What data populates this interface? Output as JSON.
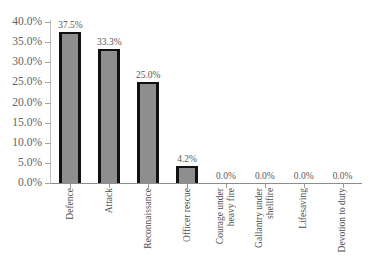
{
  "chart_data": {
    "type": "bar",
    "title": "",
    "subtitle": "",
    "xlabel": "",
    "ylabel": "",
    "ylim": [
      0,
      40
    ],
    "grid": false,
    "legend": false,
    "orientation": "vertical",
    "categories": [
      "Defence",
      "Attack",
      "Reconnaissance",
      "Officer rescue",
      "Courage under heavy fire",
      "Gallantry under shellfire",
      "Lifesaving",
      "Devotion to duty"
    ],
    "category_lines": [
      [
        "Defence"
      ],
      [
        "Attack"
      ],
      [
        "Reconnaissance"
      ],
      [
        "Officer rescue"
      ],
      [
        "Courage under",
        "heavy fire"
      ],
      [
        "Gallantry under",
        "shellfire"
      ],
      [
        "Lifesaving"
      ],
      [
        "Devotion to duty"
      ]
    ],
    "values": [
      37.5,
      33.3,
      25.0,
      4.2,
      0.0,
      0.0,
      0.0,
      0.0
    ],
    "value_labels": [
      "37.5%",
      "33.3%",
      "25.0%",
      "4.2%",
      "0.0%",
      "0.0%",
      "0.0%",
      "0.0%"
    ],
    "y_ticks": [
      0,
      5,
      10,
      15,
      20,
      25,
      30,
      35,
      40
    ],
    "y_tick_labels": [
      "0.0%",
      "5.0%",
      "10.0%",
      "15.0%",
      "20.0%",
      "25.0%",
      "30.0%",
      "35.0%",
      "40.0%"
    ],
    "colors": {
      "bar_fill": "#8e8e8e",
      "bar_edge": "#111111",
      "axis": "#8c8c8c",
      "y_axis": "#bfbfbf",
      "text": "#595959",
      "background": "#ffffff"
    }
  }
}
